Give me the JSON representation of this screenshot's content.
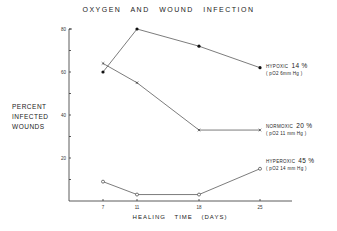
{
  "chart_data": {
    "type": "line",
    "title": "OXYGEN AND WOUND INFECTION",
    "xlabel": "HEALING TIME (DAYS)",
    "ylabel": "PERCENT INFECTED WOUNDS",
    "x": [
      7,
      11,
      18,
      25
    ],
    "xticks": [
      "7",
      "11",
      "18",
      "25"
    ],
    "yticks": [
      "20",
      "40",
      "60",
      "80"
    ],
    "ylim": [
      0,
      80
    ],
    "grid": false,
    "series": [
      {
        "name": "HYPOXIC 14% (pO2 6mm Hg)",
        "marker": "filled-dot",
        "values": [
          60,
          80,
          72,
          62
        ]
      },
      {
        "name": "NORMOXIC 20% (pO2 11 mm Hg)",
        "marker": "x",
        "values": [
          64,
          55,
          33,
          33
        ]
      },
      {
        "name": "HYPEROXIC 45% (pO2 14 mm Hg)",
        "marker": "open-circle",
        "values": [
          9,
          3,
          3,
          15
        ]
      }
    ]
  },
  "labels": {
    "title": "OXYGEN AND WOUND INFECTION",
    "ylabel_line1": "PERCENT",
    "ylabel_line2": "INFECTED",
    "ylabel_line3": "WOUNDS",
    "xlabel": "HEALING TIME (DAYS)",
    "legend": {
      "hypoxic": {
        "name": "HYPOXIC",
        "pct": "14 %",
        "sub": "( pO2  6mm Hg )"
      },
      "normoxic": {
        "name": "NORMOXIC",
        "pct": "20 %",
        "sub": "( pO2  11 mm Hg )"
      },
      "hyperoxic": {
        "name": "HYPEROXIC",
        "pct": "45 %",
        "sub": "( pO2  14 mm Hg )"
      }
    }
  }
}
